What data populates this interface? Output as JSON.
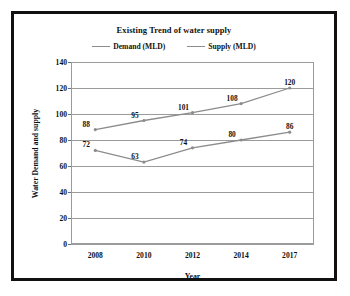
{
  "chart_data": {
    "type": "line",
    "title": "Existing Trend of water supply",
    "xlabel": "Year",
    "ylabel": "Water Demand and supply",
    "categories": [
      "2008",
      "2010",
      "2012",
      "2014",
      "2017"
    ],
    "series": [
      {
        "name": "Demand (MLD)",
        "values": [
          88,
          95,
          101,
          108,
          120
        ],
        "color": "#8c8c8c"
      },
      {
        "name": "Supply (MLD)",
        "values": [
          72,
          63,
          74,
          80,
          86
        ],
        "color": "#8c8c8c"
      }
    ],
    "ylim": [
      0,
      140
    ],
    "yticks": [
      0,
      20,
      40,
      60,
      80,
      100,
      120,
      140
    ],
    "ytick_labels": [
      "0",
      "20",
      "40",
      "60",
      "80",
      "100",
      "120",
      "140"
    ],
    "grid": true,
    "grid_axis": "y",
    "legend_position": "top",
    "show_data_labels": true
  },
  "legend": {
    "items": [
      {
        "label": "Demand (MLD)"
      },
      {
        "label": "Supply (MLD)"
      }
    ]
  }
}
